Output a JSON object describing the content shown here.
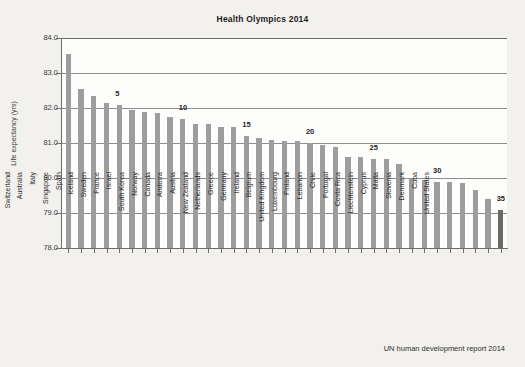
{
  "chart_data": {
    "type": "bar",
    "title": "Health Olympics 2014",
    "xlabel": "",
    "ylabel": "Life expectancy (yrs)",
    "ylim": [
      78.0,
      84.0
    ],
    "ytick_labels": [
      "84.0",
      "83.0",
      "82.0",
      "81.0",
      "80.0",
      "79.0",
      "78.0"
    ],
    "ytick_values": [
      84.0,
      83.0,
      82.0,
      81.0,
      80.0,
      79.0,
      78.0
    ],
    "grid": true,
    "legend": "none",
    "source_note": "UN human development report 2014",
    "highlight_category": "United States",
    "highlight_color": "#6a6a6a",
    "bar_color": "#9d9d9d",
    "rank_annotations": [
      {
        "rank": 5,
        "label": "5",
        "category": "Singapore"
      },
      {
        "rank": 10,
        "label": "10",
        "category": "Israel"
      },
      {
        "rank": 15,
        "label": "15",
        "category": "Austria"
      },
      {
        "rank": 20,
        "label": "20",
        "category": "Germany"
      },
      {
        "rank": 25,
        "label": "25",
        "category": "Finland"
      },
      {
        "rank": 30,
        "label": "30",
        "category": "Liechtenstein"
      },
      {
        "rank": 35,
        "label": "35",
        "category": "United States"
      }
    ],
    "categories": [
      "Japan",
      "Switzerland",
      "Australia",
      "Italy",
      "Singapore",
      "Spain",
      "Iceland",
      "Sweden",
      "France",
      "Israel",
      "South Korea",
      "Norway",
      "Canada",
      "Andorra",
      "Austria",
      "New Zealand",
      "Netherlands",
      "Greece",
      "Germany",
      "Ireland",
      "Belgium",
      "United Kingdom",
      "Luxembourg",
      "Finland",
      "Lebanon",
      "Chile",
      "Portugal",
      "Costa Rica",
      "Liechtenstein",
      "Cyprus",
      "Malta",
      "Slovenia",
      "Denmark",
      "Cuba",
      "United States"
    ],
    "values": [
      83.55,
      82.55,
      82.35,
      82.15,
      82.1,
      81.95,
      81.9,
      81.85,
      81.75,
      81.7,
      81.55,
      81.55,
      81.45,
      81.45,
      81.2,
      81.15,
      81.1,
      81.05,
      81.05,
      81.0,
      80.95,
      80.9,
      80.6,
      80.6,
      80.55,
      80.55,
      80.4,
      80.0,
      79.95,
      79.9,
      79.9,
      79.85,
      79.65,
      79.4,
      79.1
    ]
  }
}
